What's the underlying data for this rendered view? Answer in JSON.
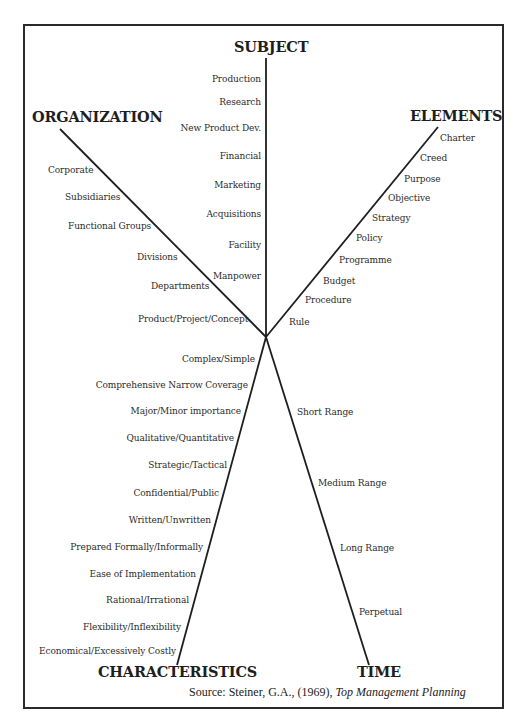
{
  "diagram": {
    "type": "radial-axes",
    "center": {
      "x": 266,
      "y": 337
    },
    "axes": {
      "subject": {
        "title": "SUBJECT",
        "items": [
          "Production",
          "Research",
          "New Product Dev.",
          "Financial",
          "Marketing",
          "Acquisitions",
          "Facility",
          "Manpower"
        ]
      },
      "organization": {
        "title": "ORGANIZATION",
        "items": [
          "Corporate",
          "Subsidiaries",
          "Functional Groups",
          "Divisions",
          "Departments",
          "Product/Project/Concept"
        ]
      },
      "elements": {
        "title": "ELEMENTS",
        "items": [
          "Charter",
          "Creed",
          "Purpose",
          "Objective",
          "Strategy",
          "Policy",
          "Programme",
          "Budget",
          "Procedure",
          "Rule"
        ]
      },
      "characteristics": {
        "title": "CHARACTERISTICS",
        "items": [
          "Complex/Simple",
          "Comprehensive Narrow Coverage",
          "Major/Minor importance",
          "Qualitative/Quantitative",
          "Strategic/Tactical",
          "Confidential/Public",
          "Written/Unwritten",
          "Prepared Formally/Informally",
          "Ease of Implementation",
          "Rational/Irrational",
          "Flexibility/Inflexibility",
          "Economical/Excessively Costly"
        ]
      },
      "time": {
        "title": "TIME",
        "items": [
          "Short Range",
          "Medium Range",
          "Long Range",
          "Perpetual"
        ]
      }
    },
    "source": {
      "prefix": "Source: Steiner, G.A., (1969), ",
      "title": "Top Management Planning"
    }
  }
}
